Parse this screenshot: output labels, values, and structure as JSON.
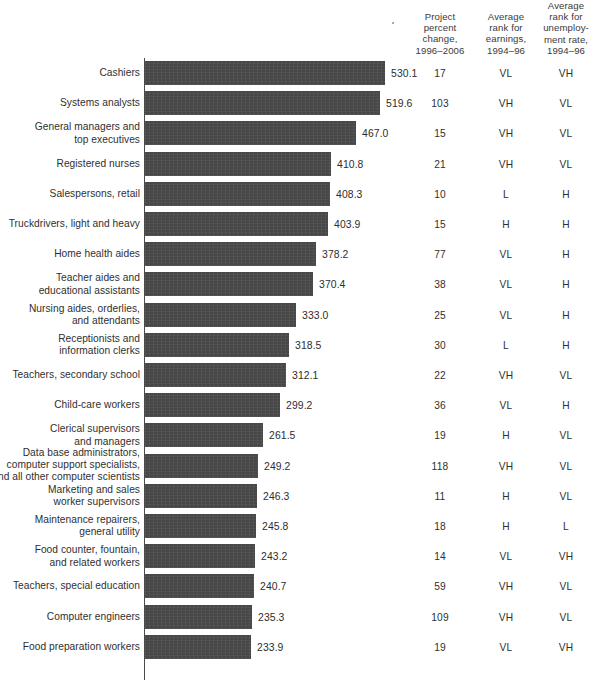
{
  "header": {
    "columns": [
      {
        "id": "percent-change",
        "label": "Project\npercent\nchange,\n1996–2006"
      },
      {
        "id": "rank-earnings",
        "label": "Average\nrank for\nearnings,\n1994–96"
      },
      {
        "id": "rank-unemployment",
        "label": "Average\nrank for\nunemploy-\nment rate,\n1994–96"
      }
    ]
  },
  "colors": {
    "bar": "#474747",
    "text": "#2f2f2f",
    "axis": "#4a4a4a",
    "background": "#ffffff"
  },
  "chart_data": {
    "type": "bar",
    "title": "",
    "xlabel": "",
    "ylabel": "",
    "orientation": "horizontal",
    "grid": false,
    "legend": "none",
    "xlim": [
      0,
      560
    ],
    "categories": [
      "Cashiers",
      "Systems  analysts",
      "General managers and\ntop executives",
      "Registered nurses",
      "Salespersons, retail",
      "Truckdrivers, light and heavy",
      "Home health aides",
      "Teacher aides and\neducational assistants",
      "Nursing aides, orderlies,\nand attendants",
      "Receptionists and\ninformation clerks",
      "Teachers, secondary school",
      "Child-care workers",
      "Clerical supervisors\nand managers",
      "Data base administrators,\ncomputer support specialists,\nand all other computer scientists",
      "Marketing and sales\nworker supervisors",
      "Maintenance repairers,\ngeneral utility",
      "Food counter, fountain,\nand related workers",
      "Teachers, special education",
      "Computer engineers",
      "Food preparation workers"
    ],
    "values": [
      530.1,
      519.6,
      467.0,
      410.8,
      408.3,
      403.9,
      378.2,
      370.4,
      333.0,
      318.5,
      312.1,
      299.2,
      261.5,
      249.2,
      246.3,
      245.8,
      243.2,
      240.7,
      235.3,
      233.9
    ],
    "value_labels": [
      "530.1",
      "519.6",
      "467.0",
      "410.8",
      "408.3",
      "403.9",
      "378.2",
      "370.4",
      "333.0",
      "318.5",
      "312.1",
      "299.2",
      "261.5",
      "249.2",
      "246.3",
      "245.8",
      "243.2",
      "240.7",
      "235.3",
      "233.9"
    ],
    "series": [
      {
        "name": "Project percent change, 1996–2006",
        "values": [
          530.1,
          519.6,
          467.0,
          410.8,
          408.3,
          403.9,
          378.2,
          370.4,
          333.0,
          318.5,
          312.1,
          299.2,
          261.5,
          249.2,
          246.3,
          245.8,
          243.2,
          240.7,
          235.3,
          233.9
        ]
      }
    ],
    "table_columns": [
      {
        "name": "Project percent change, 1996–2006",
        "values": [
          "17",
          "103",
          "15",
          "21",
          "10",
          "15",
          "77",
          "38",
          "25",
          "30",
          "22",
          "36",
          "19",
          "118",
          "11",
          "18",
          "14",
          "59",
          "109",
          "19"
        ]
      },
      {
        "name": "Average rank for earnings, 1994–96",
        "values": [
          "VL",
          "VH",
          "VH",
          "VH",
          "L",
          "H",
          "VL",
          "VL",
          "VL",
          "L",
          "VH",
          "VL",
          "H",
          "VH",
          "H",
          "H",
          "VL",
          "VH",
          "VH",
          "VL"
        ]
      },
      {
        "name": "Average rank for unemployment rate, 1994–96",
        "values": [
          "VH",
          "VL",
          "VL",
          "VL",
          "H",
          "H",
          "H",
          "H",
          "H",
          "H",
          "VL",
          "H",
          "VL",
          "VL",
          "VL",
          "L",
          "VH",
          "VL",
          "VL",
          "VH"
        ]
      }
    ]
  }
}
